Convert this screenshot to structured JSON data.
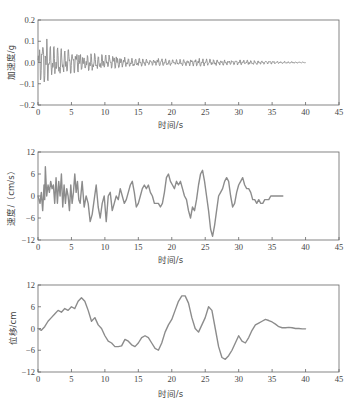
{
  "chart_data": [
    {
      "type": "line",
      "id": "acceleration",
      "title": "",
      "xlabel": "时间/s",
      "ylabel": "加速度/g",
      "xlim": [
        0,
        45
      ],
      "ylim": [
        -0.2,
        0.2
      ],
      "xticks": [
        0,
        5,
        10,
        15,
        20,
        25,
        30,
        35,
        40,
        45
      ],
      "yticks": [
        -0.2,
        -0.1,
        0.0,
        0.1,
        0.2
      ],
      "ytick_labels": [
        "−0.2",
        "−0.1",
        "0.0",
        "0.1",
        "0.2"
      ],
      "grid": false,
      "line_color": "#8c8c8c",
      "series": [
        {
          "name": "加速度",
          "style": "dense-oscillation",
          "envelope": {
            "x": [
              0,
              0.3,
              0.6,
              1.0,
              1.5,
              2,
              3,
              4,
              5,
              6,
              7,
              8,
              9,
              10,
              11,
              12,
              13,
              14,
              15,
              16,
              18,
              20,
              22,
              24,
              26,
              28,
              30,
              32,
              34,
              36,
              38,
              40
            ],
            "upper": [
              0.03,
              0.14,
              0.15,
              0.13,
              0.1,
              0.09,
              0.07,
              0.06,
              0.06,
              0.05,
              0.045,
              0.045,
              0.04,
              0.035,
              0.035,
              0.03,
              0.025,
              0.02,
              0.02,
              0.015,
              0.02,
              0.015,
              0.015,
              0.02,
              0.015,
              0.012,
              0.012,
              0.01,
              0.008,
              0.006,
              0.004,
              0.002
            ],
            "lower": [
              -0.03,
              -0.08,
              -0.12,
              -0.1,
              -0.09,
              -0.07,
              -0.06,
              -0.055,
              -0.05,
              -0.045,
              -0.04,
              -0.04,
              -0.035,
              -0.03,
              -0.03,
              -0.025,
              -0.02,
              -0.02,
              -0.02,
              -0.015,
              -0.015,
              -0.015,
              -0.015,
              -0.018,
              -0.015,
              -0.012,
              -0.012,
              -0.01,
              -0.008,
              -0.006,
              -0.004,
              -0.002
            ]
          }
        }
      ]
    },
    {
      "type": "line",
      "id": "velocity",
      "title": "",
      "xlabel": "时间/s",
      "ylabel": "速度/（cm/s）",
      "xlim": [
        0,
        45
      ],
      "ylim": [
        -12,
        12
      ],
      "xticks": [
        0,
        5,
        10,
        15,
        20,
        25,
        30,
        35,
        40,
        45
      ],
      "yticks": [
        -12,
        -6,
        0,
        6,
        12
      ],
      "ytick_labels": [
        "−12",
        "−6",
        "0",
        "6",
        "12"
      ],
      "grid": false,
      "line_color": "#8c8c8c",
      "series": [
        {
          "name": "速度",
          "x": [
            0,
            0.3,
            0.5,
            0.7,
            0.9,
            1.0,
            1.1,
            1.3,
            1.5,
            1.7,
            1.9,
            2.1,
            2.3,
            2.5,
            2.7,
            2.9,
            3.1,
            3.3,
            3.5,
            3.7,
            3.9,
            4.1,
            4.3,
            4.5,
            4.7,
            4.9,
            5.1,
            5.3,
            5.5,
            5.7,
            5.9,
            6.1,
            6.3,
            6.6,
            6.9,
            7.2,
            7.5,
            7.8,
            8.1,
            8.4,
            8.7,
            9.0,
            9.3,
            9.6,
            9.9,
            10.2,
            10.5,
            10.8,
            11.1,
            11.4,
            11.7,
            12.0,
            12.3,
            12.6,
            12.9,
            13.2,
            13.5,
            13.8,
            14.1,
            14.4,
            14.7,
            15.0,
            15.3,
            15.6,
            15.9,
            16.2,
            16.5,
            16.8,
            17.1,
            17.4,
            17.7,
            18.0,
            18.3,
            18.6,
            18.9,
            19.2,
            19.5,
            19.8,
            20.1,
            20.4,
            20.7,
            21.0,
            21.3,
            21.6,
            21.9,
            22.2,
            22.5,
            22.8,
            23.1,
            23.4,
            23.7,
            24.0,
            24.3,
            24.6,
            24.9,
            25.2,
            25.5,
            25.8,
            26.1,
            26.4,
            26.7,
            27.0,
            27.3,
            27.6,
            27.9,
            28.2,
            28.5,
            28.8,
            29.1,
            29.4,
            29.7,
            30.0,
            30.3,
            30.6,
            30.9,
            31.2,
            31.5,
            31.8,
            32.1,
            32.4,
            32.7,
            33.0,
            33.3,
            33.6,
            33.9,
            34.2,
            34.5,
            34.8,
            35.1,
            35.4,
            35.7,
            36.0,
            36.3,
            36.6,
            36.9,
            37.2,
            37.5,
            37.8,
            38.1,
            38.4,
            38.7,
            39.0,
            39.3,
            39.6,
            40.0
          ],
          "values": [
            0,
            -2,
            1,
            -4,
            3,
            -1,
            8,
            0,
            3,
            1,
            4,
            2,
            3,
            -2,
            5,
            -2,
            4,
            0,
            6,
            -3,
            3,
            -2,
            2,
            0,
            -4,
            3,
            -2,
            1,
            6,
            1,
            4,
            -1,
            -2,
            4,
            -3,
            0,
            -2,
            -7,
            -5,
            -1,
            3,
            -3,
            -6,
            -2,
            0,
            -7,
            0,
            1,
            -4,
            -2,
            0,
            -1,
            2,
            0,
            -2,
            -1,
            1,
            3,
            4,
            1,
            -3,
            -2,
            0,
            2,
            3,
            2,
            3,
            1,
            0,
            -2,
            -2,
            -2,
            -3,
            -2,
            1,
            5,
            6,
            4,
            3,
            2,
            4,
            3,
            4,
            2,
            0,
            -1,
            -4,
            -6,
            -3,
            -4,
            -1,
            3,
            6,
            7,
            4,
            0,
            -4,
            -9,
            -11,
            -8,
            -4,
            0,
            1,
            2,
            4,
            5,
            4,
            0,
            -3,
            -2,
            1,
            3,
            4,
            5,
            3,
            2,
            2,
            1,
            -1,
            -1,
            -2,
            -1,
            -2,
            -2,
            -1,
            -1,
            -1,
            0,
            0,
            0,
            0,
            0,
            0,
            0
          ],
          "values_note": "approximate trace read from gridlines"
        }
      ]
    },
    {
      "type": "line",
      "id": "displacement",
      "title": "",
      "xlabel": "时间/s",
      "ylabel": "位移/cm",
      "xlim": [
        0,
        45
      ],
      "ylim": [
        -12,
        12
      ],
      "xticks": [
        0,
        5,
        10,
        15,
        20,
        25,
        30,
        35,
        40,
        45
      ],
      "yticks": [
        -12,
        -6,
        0,
        6,
        12
      ],
      "ytick_labels": [
        "−12",
        "−6",
        "0",
        "6",
        "12"
      ],
      "grid": false,
      "line_color": "#8c8c8c",
      "series": [
        {
          "name": "位移",
          "x": [
            0,
            0.5,
            1.0,
            1.5,
            2.0,
            2.5,
            3.0,
            3.5,
            4.0,
            4.5,
            5.0,
            5.5,
            6.0,
            6.5,
            7.0,
            7.5,
            8.0,
            8.5,
            9.0,
            9.5,
            10.0,
            10.5,
            11.0,
            11.5,
            12.0,
            12.5,
            13.0,
            13.5,
            14.0,
            14.5,
            15.0,
            15.5,
            16.0,
            16.5,
            17.0,
            17.5,
            18.0,
            18.5,
            19.0,
            19.5,
            20.0,
            20.5,
            21.0,
            21.5,
            22.0,
            22.5,
            23.0,
            23.5,
            24.0,
            24.5,
            25.0,
            25.5,
            26.0,
            26.5,
            27.0,
            27.5,
            28.0,
            28.5,
            29.0,
            29.5,
            30.0,
            30.5,
            31.0,
            31.5,
            32.0,
            32.5,
            33.0,
            33.5,
            34.0,
            34.5,
            35.0,
            35.5,
            36.0,
            36.5,
            37.0,
            37.5,
            38.0,
            38.5,
            39.0,
            39.5,
            40.0
          ],
          "values": [
            0,
            -0.5,
            0.5,
            2,
            3,
            4,
            5,
            4.5,
            5.5,
            5,
            6,
            5.5,
            7.5,
            8.5,
            7.5,
            5,
            2,
            3,
            1,
            0,
            -2,
            -3.5,
            -4,
            -5,
            -5,
            -4.8,
            -3,
            -3.5,
            -4.5,
            -5,
            -4,
            -2.5,
            -2,
            -2.5,
            -4,
            -5.5,
            -6,
            -4,
            -1,
            1,
            2.5,
            5,
            7.5,
            9,
            9,
            7,
            3,
            0,
            -1,
            1,
            3,
            6,
            5,
            0,
            -5,
            -8,
            -8.5,
            -7.5,
            -6,
            -4,
            -2,
            -3.5,
            -4,
            -2.5,
            -0.5,
            1,
            1.5,
            2,
            2.5,
            2.2,
            1.8,
            1.2,
            0.5,
            0.2,
            0.2,
            0.3,
            0.2,
            0,
            0,
            -0.1,
            -0.1
          ],
          "values_note": "approximate trace read from gridlines"
        }
      ]
    }
  ]
}
